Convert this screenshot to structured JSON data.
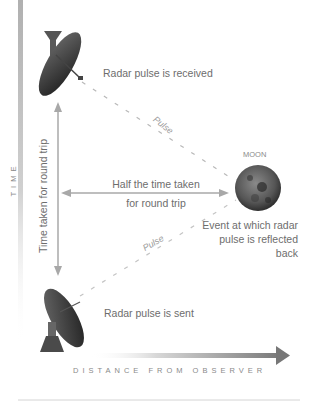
{
  "diagram": {
    "labels": {
      "received": "Radar pulse is received",
      "sent": "Radar pulse is sent",
      "moon": "MOON",
      "half_time_line1": "Half the time taken",
      "half_time_line2": "for round trip",
      "round_trip": "Time taken for round trip",
      "reflect_line1": "Event at which radar",
      "reflect_line2": "pulse is reflected",
      "reflect_line3": "back",
      "pulse_upper": "Pulse",
      "pulse_lower": "Pulse"
    },
    "axes": {
      "y_label": "TIME",
      "x_label": "DISTANCE FROM OBSERVER"
    },
    "colors": {
      "axis": "#9a9a9a",
      "arrow": "#a8a8a8",
      "text": "#6d6d6d",
      "moon": "#4a4a4a",
      "dish": "#2e2e2e"
    }
  }
}
